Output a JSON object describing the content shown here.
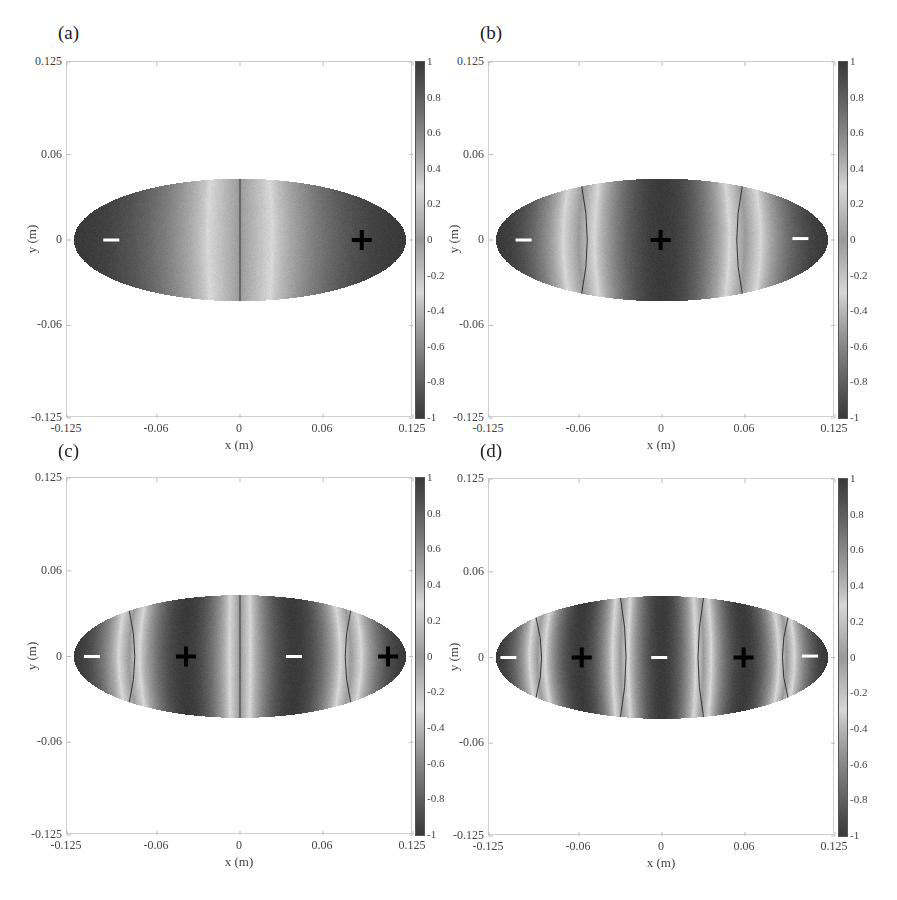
{
  "chart_data": [
    {
      "type": "heatmap",
      "panel": "(a)",
      "title": "",
      "xlabel": "x (m)",
      "ylabel": "y (m)",
      "xlim": [
        -0.125,
        0.125
      ],
      "ylim": [
        -0.125,
        0.125
      ],
      "xticks": [
        "-0.125",
        "-0.06",
        "0",
        "0.06",
        "0.125"
      ],
      "yticks": [
        "0.125",
        "0.06",
        "0",
        "-0.06",
        "-0.125"
      ],
      "colorbar": {
        "range": [
          -1,
          1
        ],
        "ticks": [
          "1",
          "0.8",
          "0.6",
          "0.4",
          "0.2",
          "0",
          "-0.2",
          "-0.4",
          "-0.6",
          "-0.8",
          "-1"
        ]
      },
      "domain_shape": "ellipse",
      "ellipse_semi_axes_m": [
        0.12,
        0.043
      ],
      "mode": 1,
      "nodal_lines_x_m": [
        0
      ],
      "markers": [
        {
          "sign": "-",
          "x": -0.093,
          "y": 0
        },
        {
          "sign": "+",
          "x": 0.088,
          "y": 0
        }
      ]
    },
    {
      "type": "heatmap",
      "panel": "(b)",
      "title": "",
      "xlabel": "x (m)",
      "ylabel": "y (m)",
      "xlim": [
        -0.125,
        0.125
      ],
      "ylim": [
        -0.125,
        0.125
      ],
      "xticks": [
        "-0.125",
        "-0.06",
        "0",
        "0.06",
        "0.125"
      ],
      "yticks": [
        "0.125",
        "0.06",
        "0",
        "-0.06",
        "-0.125"
      ],
      "colorbar": {
        "range": [
          -1,
          1
        ],
        "ticks": [
          "1",
          "0.8",
          "0.6",
          "0.4",
          "0.2",
          "0",
          "-0.2",
          "-0.4",
          "-0.6",
          "-0.8",
          "-1"
        ]
      },
      "domain_shape": "ellipse",
      "ellipse_semi_axes_m": [
        0.12,
        0.043
      ],
      "mode": 2,
      "nodal_lines_x_m": [
        -0.058,
        0.058
      ],
      "markers": [
        {
          "sign": "-",
          "x": -0.1,
          "y": 0
        },
        {
          "sign": "+",
          "x": -0.001,
          "y": 0
        },
        {
          "sign": "-",
          "x": 0.1,
          "y": 0.001
        }
      ]
    },
    {
      "type": "heatmap",
      "panel": "(c)",
      "title": "",
      "xlabel": "x (m)",
      "ylabel": "y (m)",
      "xlim": [
        -0.125,
        0.125
      ],
      "ylim": [
        -0.125,
        0.125
      ],
      "xticks": [
        "-0.125",
        "-0.06",
        "0",
        "0.06",
        "0.125"
      ],
      "yticks": [
        "0.125",
        "0.06",
        "0",
        "-0.06",
        "-0.125"
      ],
      "colorbar": {
        "range": [
          -1,
          1
        ],
        "ticks": [
          "1",
          "0.8",
          "0.6",
          "0.4",
          "0.2",
          "0",
          "-0.2",
          "-0.4",
          "-0.6",
          "-0.8",
          "-1"
        ]
      },
      "domain_shape": "ellipse",
      "ellipse_semi_axes_m": [
        0.12,
        0.043
      ],
      "mode": 3,
      "nodal_lines_x_m": [
        -0.08,
        0,
        0.08
      ],
      "markers": [
        {
          "sign": "-",
          "x": -0.107,
          "y": 0
        },
        {
          "sign": "+",
          "x": -0.039,
          "y": 0
        },
        {
          "sign": "-",
          "x": 0.039,
          "y": 0
        },
        {
          "sign": "+",
          "x": 0.107,
          "y": 0
        }
      ]
    },
    {
      "type": "heatmap",
      "panel": "(d)",
      "title": "",
      "xlabel": "x (m)",
      "ylabel": "y (m)",
      "xlim": [
        -0.125,
        0.125
      ],
      "ylim": [
        -0.125,
        0.125
      ],
      "xticks": [
        "-0.125",
        "-0.06",
        "0",
        "0.06",
        "0.125"
      ],
      "yticks": [
        "0.125",
        "0.06",
        "0",
        "-0.06",
        "-0.125"
      ],
      "colorbar": {
        "range": [
          -1,
          1
        ],
        "ticks": [
          "1",
          "0.8",
          "0.6",
          "0.4",
          "0.2",
          "0",
          "-0.2",
          "-0.4",
          "-0.6",
          "-0.8",
          "-1"
        ]
      },
      "domain_shape": "ellipse",
      "ellipse_semi_axes_m": [
        0.12,
        0.043
      ],
      "mode": 4,
      "nodal_lines_x_m": [
        -0.091,
        -0.03,
        0.03,
        0.091
      ],
      "markers": [
        {
          "sign": "-",
          "x": -0.111,
          "y": 0
        },
        {
          "sign": "+",
          "x": -0.058,
          "y": 0
        },
        {
          "sign": "-",
          "x": -0.002,
          "y": 0
        },
        {
          "sign": "+",
          "x": 0.059,
          "y": 0
        },
        {
          "sign": "-",
          "x": 0.107,
          "y": 0.001
        }
      ]
    }
  ],
  "colors": {
    "dark": "#3a3a3a",
    "light": "#d8d8d8",
    "mid": "#9a9a9a",
    "nodal_line": "#333333",
    "plus_marker": "#000000",
    "minus_marker": "#ffffff"
  }
}
